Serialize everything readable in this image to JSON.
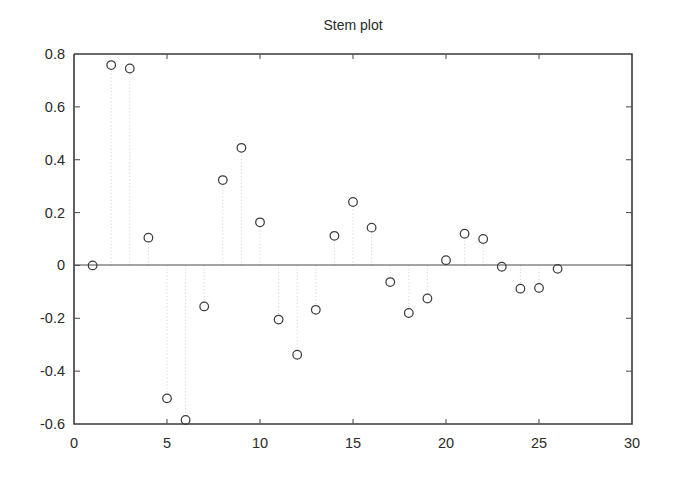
{
  "chart_data": {
    "type": "scatter",
    "title": "Stem plot",
    "xlabel": "",
    "ylabel": "",
    "xlim": [
      0,
      30
    ],
    "ylim": [
      -0.6,
      0.8
    ],
    "xticks": [
      0,
      5,
      10,
      15,
      20,
      25,
      30
    ],
    "xtick_labels": [
      "0",
      "5",
      "10",
      "15",
      "20",
      "25",
      "30"
    ],
    "yticks": [
      -0.6,
      -0.4,
      -0.2,
      0,
      0.2,
      0.4,
      0.6,
      0.8
    ],
    "ytick_labels": [
      "-0.6",
      "-0.4",
      "-0.2",
      "0",
      "0.2",
      "0.4",
      "0.6",
      "0.8"
    ],
    "grid": false,
    "legend": null,
    "marker": "open-circle",
    "baseline": 0,
    "x": [
      1,
      2,
      3,
      4,
      5,
      6,
      7,
      8,
      9,
      10,
      11,
      12,
      13,
      14,
      15,
      16,
      17,
      18,
      19,
      20,
      21,
      22,
      23,
      24,
      25,
      26
    ],
    "y": [
      0.0,
      0.758,
      0.745,
      0.105,
      -0.503,
      -0.585,
      -0.155,
      0.323,
      0.445,
      0.163,
      -0.205,
      -0.338,
      -0.168,
      0.112,
      0.24,
      0.143,
      -0.063,
      -0.18,
      -0.125,
      0.02,
      0.12,
      0.1,
      -0.005,
      -0.088,
      -0.085,
      -0.013
    ]
  }
}
